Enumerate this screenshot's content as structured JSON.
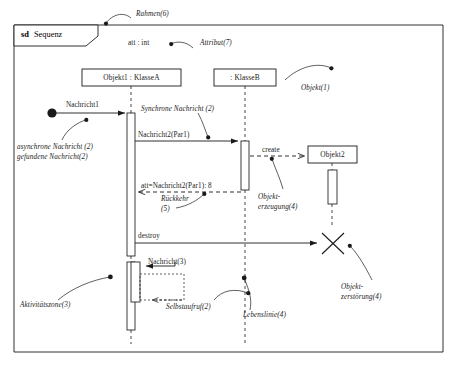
{
  "diagram": {
    "type": "uml-sequence-diagram",
    "frame": {
      "keyword": "sd",
      "name": "Sequenz",
      "annotation": "Rahmen(6)"
    },
    "attribute": {
      "text": "att : int",
      "annotation": "Attribut(7)"
    },
    "lifelines": [
      {
        "id": "objekt1",
        "label": "Objekt1 : KlasseA",
        "x": 131
      },
      {
        "id": "klasseb",
        "label": ": KlasseB",
        "x": 245
      },
      {
        "id": "objekt2",
        "label": "Objekt2",
        "x": 332
      }
    ],
    "lifeline_annotations": {
      "objekt_creation_label": "Objekt(1)",
      "lifeline_label": "Lebenslinie(4)",
      "activation_label": "Aktivitätszone(3)"
    },
    "messages": [
      {
        "id": "m1",
        "label": "Nachricht1",
        "kind": "found-asynchronous",
        "annotation_line1": "asynchrone Nachricht (2)",
        "annotation_line2": "gefundene Nachricht(2)"
      },
      {
        "id": "m2",
        "label": "Nachricht2(Par1)",
        "kind": "synchronous",
        "annotation": "Synchrone Nachricht (2)"
      },
      {
        "id": "m3",
        "label": "create",
        "kind": "create",
        "annotation_line1": "Objekt-",
        "annotation_line2": "erzeugung(4)"
      },
      {
        "id": "m4",
        "label": "att=Nachricht2(Par1): 8",
        "kind": "reply",
        "annotation_line1": "Rückkehr",
        "annotation_line2": "(5)"
      },
      {
        "id": "m5",
        "label": "destroy",
        "kind": "destroy",
        "annotation_line1": "Objekt-",
        "annotation_line2": "zerstörung(4)"
      },
      {
        "id": "m6",
        "label": "Nachricht(3)",
        "kind": "synchronous"
      },
      {
        "id": "m7",
        "label": "",
        "kind": "self-call",
        "annotation": "Selbstaufruf(2)"
      }
    ],
    "colors": {
      "stroke": "#1a1a1a",
      "fill": "#ffffff",
      "background": "#ffffff"
    }
  }
}
